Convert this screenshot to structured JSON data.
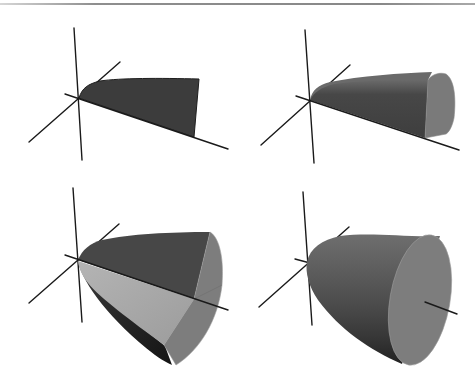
{
  "figure": {
    "panels": [
      {
        "id": "panel-1",
        "position": "top-left",
        "stage": "planar region"
      },
      {
        "id": "panel-2",
        "position": "top-right",
        "stage": "region partially revolved"
      },
      {
        "id": "panel-3",
        "position": "bottom-left",
        "stage": "region revolved about half-way"
      },
      {
        "id": "panel-4",
        "position": "bottom-right",
        "stage": "complete solid of revolution"
      }
    ],
    "colors": {
      "background": "#ffffff",
      "axis": "#1a1a1a",
      "region_dark": "#3c3c3c",
      "surface_mid": "#5f5f5f",
      "surface_light": "#a9a9a9",
      "cap": "#7d7d7d",
      "top_rule": "#8e8e8e"
    }
  }
}
